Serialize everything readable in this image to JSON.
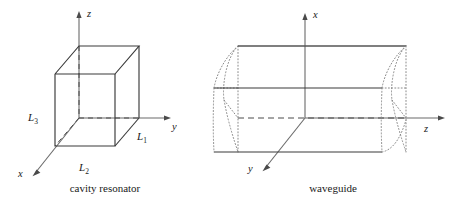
{
  "figure": {
    "background_color": "#ffffff",
    "line_color": "#3a3a3a",
    "axis_color": "#555555",
    "text_color": "#1a1a1a"
  },
  "panels": [
    {
      "id": "cavity-resonator",
      "caption": "cavity resonator",
      "axes": [
        {
          "name": "z-axis",
          "label": "z",
          "direction": "up"
        },
        {
          "name": "y-axis",
          "label": "y",
          "direction": "right"
        },
        {
          "name": "x-axis",
          "label": "x",
          "direction": "down-left"
        }
      ],
      "dimensions": [
        {
          "name": "L3",
          "base": "L",
          "subscript": "3",
          "edge": "vertical-left-front"
        },
        {
          "name": "L2",
          "base": "L",
          "subscript": "2",
          "edge": "bottom-front"
        },
        {
          "name": "L1",
          "base": "L",
          "subscript": "1",
          "edge": "depth-right"
        }
      ],
      "shape": "cube"
    },
    {
      "id": "waveguide",
      "caption": "waveguide",
      "axes": [
        {
          "name": "x-axis",
          "label": "x",
          "direction": "up"
        },
        {
          "name": "z-axis",
          "label": "z",
          "direction": "right"
        },
        {
          "name": "y-axis",
          "label": "y",
          "direction": "down-left"
        }
      ],
      "dimensions": [],
      "shape": "elongated-rectangular-tube"
    }
  ]
}
